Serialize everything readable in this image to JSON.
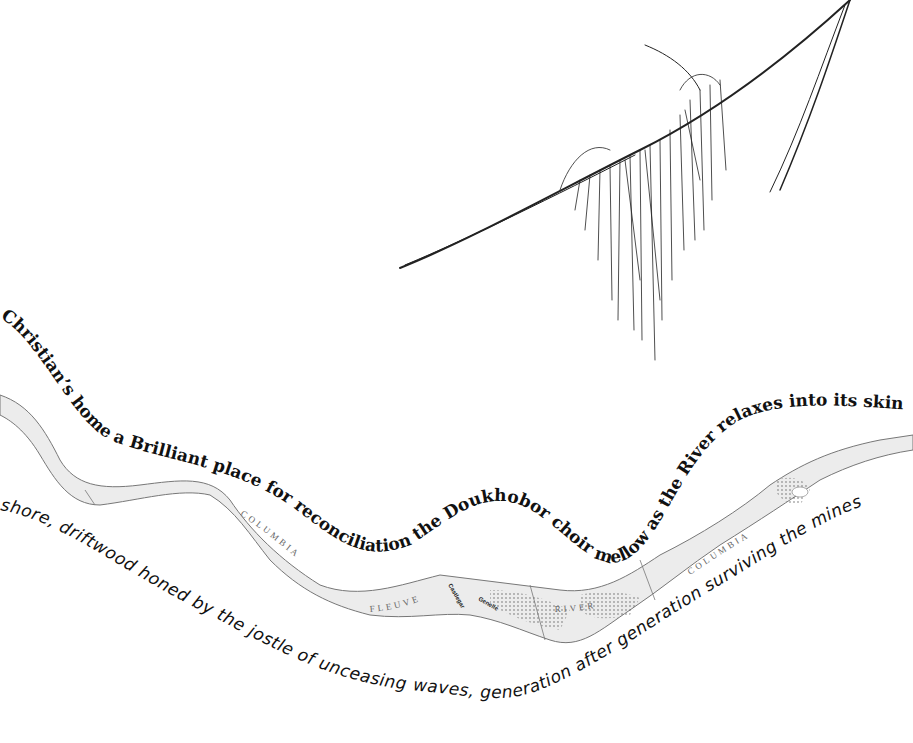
{
  "artwork": {
    "type": "concrete poem with river map and branch sketch",
    "colors": {
      "background": "#ffffff",
      "ink": "#111111",
      "river_fill": "#ececec",
      "river_edge": "#777777"
    }
  },
  "poem": {
    "serif_line": "Christian’s home a Brilliant place for reconciliation the Doukhobor choir mellow as the River relaxes into its skin between",
    "handwritten_line": "shore, driftwood honed by the jostle of unceasing waves, generation after generation surviving the mines"
  },
  "map": {
    "labels": [
      {
        "text": "COLUMBIA"
      },
      {
        "text": "FLEUVE"
      },
      {
        "text": "RIVER"
      },
      {
        "text": "COLUMBIA"
      }
    ],
    "small_labels": [
      {
        "text": "Castlegar"
      },
      {
        "text": "Genelle"
      }
    ]
  },
  "sketch": {
    "subject": "branch with hanging lichen"
  }
}
